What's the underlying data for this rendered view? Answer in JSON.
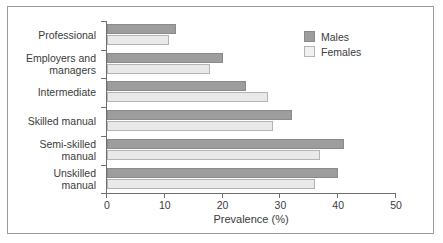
{
  "chart_data": {
    "type": "bar",
    "orientation": "horizontal",
    "title": "",
    "xlabel": "Prevalence (%)",
    "ylabel": "",
    "xlim": [
      0,
      50
    ],
    "xticks": [
      0,
      10,
      20,
      30,
      40,
      50
    ],
    "grid": false,
    "legend_position": "top-right",
    "categories": [
      "Professional",
      "Employers and managers",
      "Intermediate",
      "Skilled manual",
      "Semi-skilled manual",
      "Unskilled manual"
    ],
    "category_lines": [
      [
        "Professional"
      ],
      [
        "Employers and",
        "managers"
      ],
      [
        "Intermediate"
      ],
      [
        "Skilled manual"
      ],
      [
        "Semi-skilled",
        "manual"
      ],
      [
        "Unskilled",
        "manual"
      ]
    ],
    "series": [
      {
        "name": "Males",
        "color": "#9d9d9d",
        "values": [
          12,
          20,
          24,
          32,
          41,
          40
        ]
      },
      {
        "name": "Females",
        "color": "#e9e9e9",
        "values": [
          10.8,
          17.8,
          27.8,
          28.8,
          36.8,
          36
        ]
      }
    ]
  },
  "legend": {
    "items": [
      {
        "label": "Males"
      },
      {
        "label": "Females"
      }
    ]
  },
  "axis": {
    "x_title": "Prevalence (%)",
    "tick_labels": [
      "0",
      "10",
      "20",
      "30",
      "40",
      "50"
    ]
  }
}
